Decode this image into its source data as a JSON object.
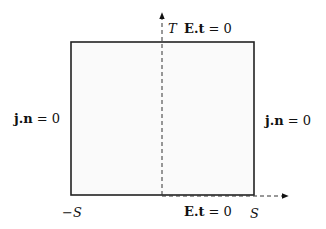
{
  "diagram": {
    "type": "boundary-conditions-rectangle",
    "domain": {
      "x_min_label": "−S",
      "x_max_label": "S",
      "t_max_label": "T"
    },
    "boundaries": {
      "top": {
        "label_bold": "E.t",
        "label_rest": " = 0"
      },
      "bottom_right_half": {
        "label_bold": "E.t",
        "label_rest": " = 0"
      },
      "left": {
        "label_bold": "j.n",
        "label_rest": " = 0"
      },
      "right": {
        "label_bold": "j.n",
        "label_rest": " = 0"
      }
    },
    "colors": {
      "stroke": "#222222",
      "fill": "#fafafa",
      "axis": "#333333"
    }
  }
}
